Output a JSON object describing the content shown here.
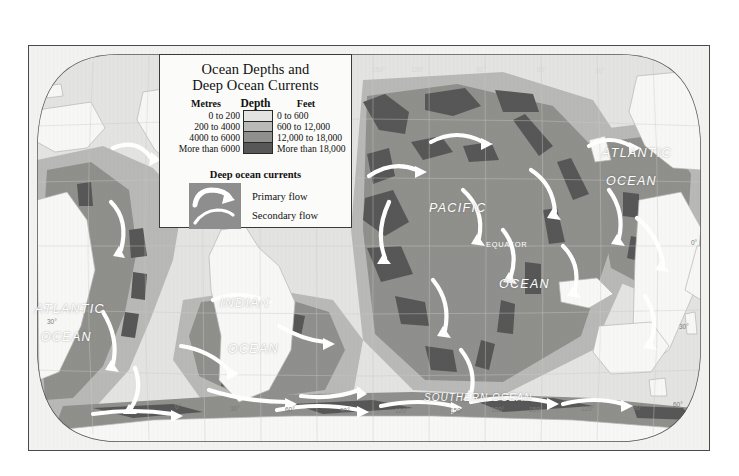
{
  "legend": {
    "title_line1": "Ocean Depths and",
    "title_line2": "Deep Ocean Currents",
    "depth_heading": "Depth",
    "metres_heading": "Metres",
    "feet_heading": "Feet",
    "metres_classes": [
      "0 to 200",
      "200 to 4000",
      "4000 to 6000",
      "More than 6000"
    ],
    "feet_classes": [
      "0 to 600",
      "600 to 12,000",
      "12,000 to 18,000",
      "More than 18,000"
    ],
    "swatch_colors": [
      "#e3e3e1",
      "#b9b9b7",
      "#8f8f8d",
      "#575757"
    ],
    "currents_heading": "Deep ocean currents",
    "primary_flow_label": "Primary flow",
    "secondary_flow_label": "Secondary flow",
    "currents_swatch_color": "#8e8e8e",
    "current_arrow_color": "#ffffff"
  },
  "map": {
    "ocean_labels": [
      {
        "name": "atlantic-west",
        "line1": "ATLANTIC",
        "line2": "OCEAN",
        "x": 22,
        "y": 258
      },
      {
        "name": "atlantic-east",
        "line1": "ATLANTIC",
        "line2": "OCEAN",
        "x": 601,
        "y": 143
      },
      {
        "name": "indian",
        "line1": "INDIAN",
        "line2": "OCEAN",
        "x": 218,
        "y": 292
      },
      {
        "name": "pacific",
        "line1": "PACIFIC",
        "line2": "OCEAN",
        "x": 428,
        "y": 200
      },
      {
        "name": "southern",
        "line1": "SOUTHERN   OCEAN",
        "line2": "",
        "x": 428,
        "y": 392
      }
    ],
    "equator_label": "EQUATOR",
    "longitude_bottom": [
      "0°",
      "30°",
      "60°",
      "90°",
      "120°",
      "150°",
      "180°",
      "150°",
      "120°",
      "90°",
      "60°",
      "30°"
    ],
    "longitude_top": [
      "180°",
      "150°",
      "120°",
      "90°",
      "60°",
      "30°"
    ],
    "latitude_left": [
      "30°"
    ],
    "latitude_right": [
      "0°",
      "30°"
    ],
    "land_color": "#f7f7f5",
    "frame_color": "#4a4a4a",
    "page_background": "#ffffff"
  }
}
